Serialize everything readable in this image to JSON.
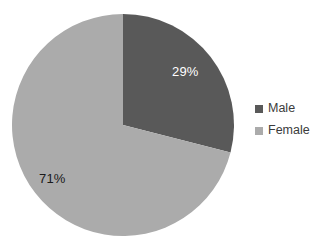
{
  "chart_data": {
    "type": "pie",
    "title": "",
    "categories": [
      "Male",
      "Female"
    ],
    "values": [
      29,
      71
    ],
    "value_unit": "%",
    "data_labels": [
      "29%",
      "71%"
    ],
    "colors": [
      "#595959",
      "#ababab"
    ],
    "legend": {
      "position": "right",
      "entries": [
        {
          "label": "Male",
          "color": "#595959",
          "swatch_icon": "square-swatch-icon"
        },
        {
          "label": "Female",
          "color": "#ababab",
          "swatch_icon": "square-swatch-icon"
        }
      ]
    },
    "start_angle_deg": 0,
    "direction": "clockwise",
    "grid": false,
    "xlabel": "",
    "ylabel": ""
  },
  "pie": {
    "center_x": 123,
    "center_y": 125,
    "radius": 111,
    "slices": [
      {
        "name": "Male",
        "label": "29%",
        "label_color": "#ffffff",
        "fill": "#595959",
        "path": "M 123 14 A 111 111 0 0 1 230.8 151.8 L 123 125 Z"
      },
      {
        "name": "Female",
        "label": "71%",
        "label_color": "#1a1a1a",
        "fill": "#ababab",
        "path": "M 230.8 151.8 A 111 111 0 1 1 123 14 L 123 125 Z"
      }
    ]
  },
  "canvas": {
    "background": "#ffffff",
    "width": 327,
    "height": 249
  }
}
